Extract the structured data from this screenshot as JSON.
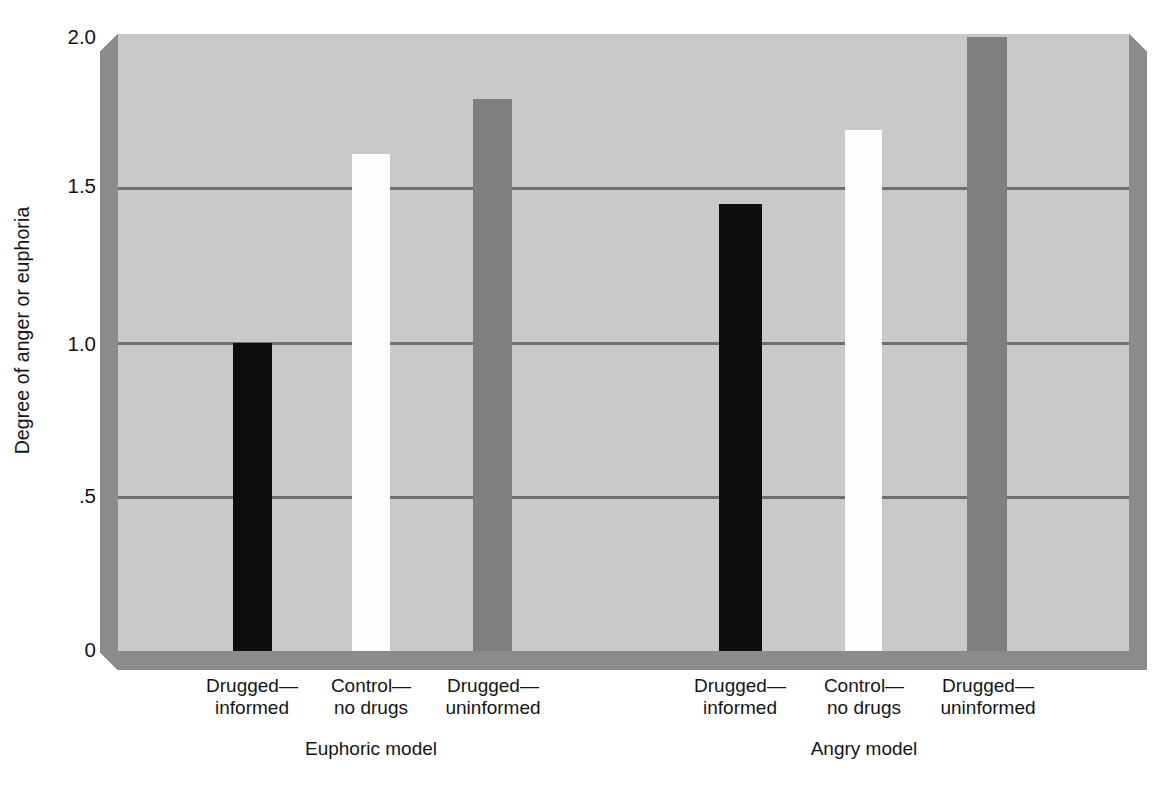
{
  "chart_data": {
    "type": "bar",
    "title": "",
    "xlabel": "",
    "ylabel": "Degree of anger or euphoria",
    "ylim": [
      0,
      2.0
    ],
    "yticks": [
      "0",
      ".5",
      "1.0",
      "1.5",
      "2.0"
    ],
    "ytick_values": [
      0,
      0.5,
      1.0,
      1.5,
      2.0
    ],
    "grid": true,
    "gridlines_at": [
      0.5,
      1.0,
      1.5
    ],
    "legend": "none",
    "groups": [
      {
        "name": "Euphoric model",
        "categories": [
          "Drugged—informed",
          "Control—no drugs",
          "Drugged—uninformed"
        ],
        "category_lines": [
          [
            "Drugged—",
            "informed"
          ],
          [
            "Control—",
            "no drugs"
          ],
          [
            "Drugged—",
            "uninformed"
          ]
        ],
        "values": [
          1.0,
          1.61,
          1.79
        ],
        "colors": [
          "#0d0d0d",
          "#fdfdfd",
          "#7f7f7f"
        ]
      },
      {
        "name": "Angry model",
        "categories": [
          "Drugged—informed",
          "Control—no drugs",
          "Drugged—uninformed"
        ],
        "category_lines": [
          [
            "Drugged—",
            "informed"
          ],
          [
            "Control—",
            "no drugs"
          ],
          [
            "Drugged—",
            "uninformed"
          ]
        ],
        "values": [
          1.45,
          1.69,
          1.99
        ],
        "colors": [
          "#0d0d0d",
          "#fdfdfd",
          "#7f7f7f"
        ]
      }
    ],
    "bar_geometry": [
      {
        "left": 115,
        "width": 39,
        "value": 1.0,
        "color": "#0d0d0d"
      },
      {
        "left": 234,
        "width": 38,
        "value": 1.61,
        "color": "#fdfdfd"
      },
      {
        "left": 355,
        "width": 39,
        "value": 1.79,
        "color": "#7f7f7f"
      },
      {
        "left": 601,
        "width": 43,
        "value": 1.45,
        "color": "#0d0d0d"
      },
      {
        "left": 727,
        "width": 37,
        "value": 1.69,
        "color": "#fdfdfd"
      },
      {
        "left": 849,
        "width": 40,
        "value": 1.99,
        "color": "#7f7f7f"
      }
    ],
    "colors": {
      "plot_background": "#c9c9c9",
      "panel_shadow": "#8b8b8b",
      "gridline": "#6f6f6f",
      "text": "#151515",
      "page_background": "#ffffff"
    }
  },
  "axis": {
    "y_title": "Degree of anger or euphoria",
    "ticks": [
      {
        "label": "2.0",
        "top": 27
      },
      {
        "label": "1.5",
        "top": 176
      },
      {
        "label": "1.0",
        "top": 334
      },
      {
        "label": ".5",
        "top": 486
      },
      {
        "label": "0",
        "top": 640
      }
    ]
  },
  "category_labels": [
    {
      "line1": "Drugged—",
      "line2": "informed",
      "center": 252
    },
    {
      "line1": "Control—",
      "line2": "no drugs",
      "center": 371
    },
    {
      "line1": "Drugged—",
      "line2": "uninformed",
      "center": 493
    },
    {
      "line1": "Drugged—",
      "line2": "informed",
      "center": 740
    },
    {
      "line1": "Control—",
      "line2": "no drugs",
      "center": 864
    },
    {
      "line1": "Drugged—",
      "line2": "uninformed",
      "center": 988
    }
  ],
  "group_labels": [
    {
      "label": "Euphoric model",
      "center": 371
    },
    {
      "label": "Angry model",
      "center": 864
    }
  ]
}
